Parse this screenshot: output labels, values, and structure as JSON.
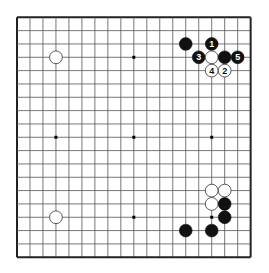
{
  "board": {
    "size": 19,
    "origin": {
      "x": 17,
      "y": 17.3
    },
    "spacing": {
      "x": 12.98,
      "y": 13.33
    },
    "line_color": "#555555",
    "border_color": "#222222",
    "background": "#ffffff",
    "star_points": [
      [
        3,
        3
      ],
      [
        9,
        3
      ],
      [
        15,
        3
      ],
      [
        3,
        9
      ],
      [
        9,
        9
      ],
      [
        15,
        9
      ],
      [
        3,
        15
      ],
      [
        9,
        15
      ],
      [
        15,
        15
      ]
    ]
  },
  "stones": [
    {
      "color": "black",
      "col": 13,
      "row": 2,
      "label": ""
    },
    {
      "color": "black",
      "col": 15,
      "row": 2,
      "label": "1"
    },
    {
      "color": "black",
      "col": 14,
      "row": 3,
      "label": "3"
    },
    {
      "color": "white",
      "col": 15,
      "row": 3,
      "label": ""
    },
    {
      "color": "black",
      "col": 16,
      "row": 3,
      "label": ""
    },
    {
      "color": "black",
      "col": 17,
      "row": 3,
      "label": "5"
    },
    {
      "color": "white",
      "col": 15,
      "row": 4,
      "label": "4"
    },
    {
      "color": "white",
      "col": 16,
      "row": 4,
      "label": "2"
    },
    {
      "color": "white",
      "col": 3,
      "row": 3,
      "label": ""
    },
    {
      "color": "white",
      "col": 3,
      "row": 15,
      "label": ""
    },
    {
      "color": "white",
      "col": 15,
      "row": 13,
      "label": ""
    },
    {
      "color": "white",
      "col": 16,
      "row": 13,
      "label": ""
    },
    {
      "color": "white",
      "col": 15,
      "row": 14,
      "label": ""
    },
    {
      "color": "black",
      "col": 16,
      "row": 14,
      "label": ""
    },
    {
      "color": "black",
      "col": 16,
      "row": 15,
      "label": ""
    },
    {
      "color": "black",
      "col": 13,
      "row": 16,
      "label": ""
    },
    {
      "color": "black",
      "col": 15,
      "row": 16,
      "label": ""
    }
  ]
}
